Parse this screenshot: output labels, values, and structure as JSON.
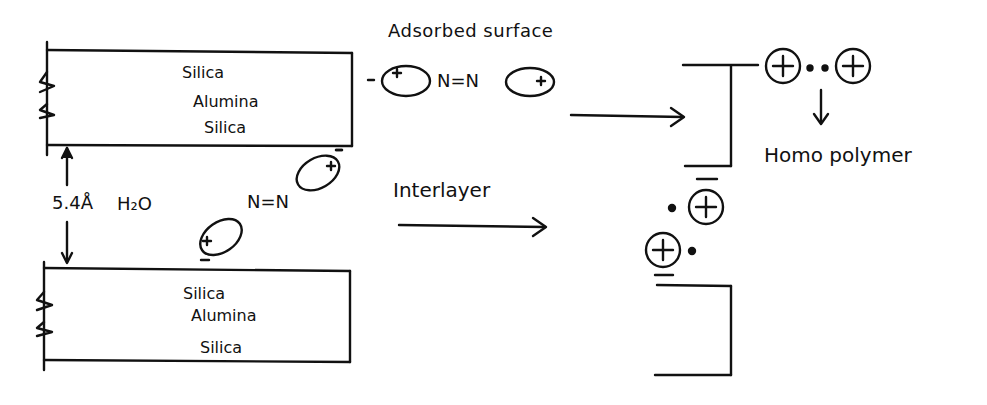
{
  "diagram": {
    "top_layer": {
      "lines": [
        "Silica",
        "Alumina",
        "Silica"
      ]
    },
    "bottom_layer": {
      "lines": [
        "Silica",
        "Alumina",
        "Silica"
      ]
    },
    "spacing_label": "5.4Å",
    "water_label": "H₂O",
    "adsorbed_surface_label": "Adsorbed surface",
    "interlayer_label": "Interlayer",
    "azo_label_top": "N=N",
    "azo_label_mid": "N=N",
    "homo_polymer_label": "Homo polymer",
    "charge_minus": "-",
    "charge_plus": "+"
  }
}
